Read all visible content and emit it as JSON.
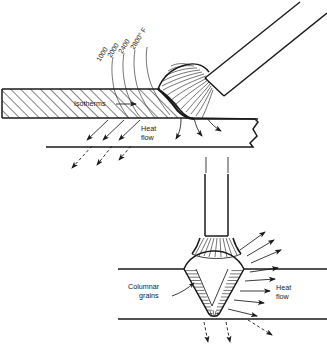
{
  "figure": {
    "panels": [
      {
        "id": "top-panel",
        "name": "Arc welding heat flow with isotherms",
        "labels": {
          "isotherms": "Isotherms",
          "heat_flow_line1": "Heat",
          "heat_flow_line2": "flow"
        },
        "isotherm_values": [
          "1000",
          "2000",
          "2400",
          "2800° F"
        ]
      },
      {
        "id": "bottom-panel",
        "name": "V-groove weld columnar grain structure",
        "labels": {
          "columnar_line1": "Columnar",
          "columnar_line2": "grains",
          "heat_flow_line1": "Heat",
          "heat_flow_line2": "flow"
        }
      }
    ]
  },
  "colors": {
    "ink": "#1a1a1a",
    "background": "#ffffff"
  }
}
